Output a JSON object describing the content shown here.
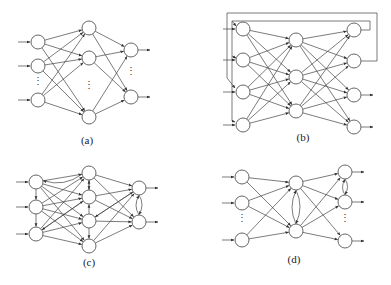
{
  "figure": {
    "panels": [
      {
        "id": "a",
        "label": "(a)",
        "label_pos": [
          87,
          144
        ],
        "nodes": {
          "input": [
            [
              38,
              42
            ],
            [
              38,
              66
            ],
            [
              38,
              100
            ]
          ],
          "hidden": [
            [
              89,
              28
            ],
            [
              89,
              58
            ],
            [
              89,
              117
            ]
          ],
          "output": [
            [
              131,
              50
            ],
            [
              131,
              97
            ]
          ]
        },
        "ellipsis": [
          [
            38,
            84
          ],
          [
            89,
            88
          ],
          [
            131,
            74
          ]
        ],
        "description": "Feedforward network with one hidden layer"
      },
      {
        "id": "b",
        "label": "(b)",
        "label_pos": [
          303,
          141
        ],
        "nodes": {
          "input": [
            [
              243,
              29
            ],
            [
              243,
              60
            ],
            [
              243,
              92
            ],
            [
              243,
              125
            ]
          ],
          "hidden": [
            [
              296,
              40
            ],
            [
              296,
              77
            ],
            [
              296,
              111
            ]
          ],
          "output": [
            [
              354,
              30
            ],
            [
              354,
              61
            ],
            [
              354,
              95
            ],
            [
              354,
              127
            ]
          ]
        },
        "description": "Recurrent network with output-to-input feedback loops"
      },
      {
        "id": "c",
        "label": "(c)",
        "label_pos": [
          89,
          266
        ],
        "nodes": {
          "input": [
            [
              36,
              182
            ],
            [
              36,
              207
            ],
            [
              36,
              234
            ]
          ],
          "hidden": [
            [
              89,
              173
            ],
            [
              89,
              197
            ],
            [
              89,
              221
            ],
            [
              89,
              246
            ]
          ],
          "output": [
            [
              139,
              188
            ],
            [
              139,
              222
            ]
          ]
        },
        "description": "Network with lateral connections within layers"
      },
      {
        "id": "d",
        "label": "(d)",
        "label_pos": [
          294,
          263
        ],
        "nodes": {
          "input": [
            [
              242,
              177
            ],
            [
              242,
              203
            ],
            [
              242,
              240
            ]
          ],
          "hidden": [
            [
              296,
              183
            ],
            [
              296,
              231
            ]
          ],
          "output": [
            [
              345,
              172
            ],
            [
              345,
              202
            ],
            [
              345,
              241
            ]
          ]
        },
        "ellipsis": [
          [
            242,
            221
          ],
          [
            345,
            221
          ]
        ],
        "description": "Network with recurrent connections in hidden and output layers"
      }
    ],
    "node_radius": 7,
    "colors": {
      "stroke": "#555555",
      "fill": "#ffffff",
      "background": "#ffffff"
    }
  }
}
